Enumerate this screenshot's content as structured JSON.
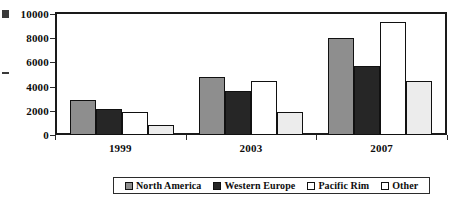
{
  "chart_data": {
    "type": "bar",
    "title": "",
    "xlabel": "",
    "ylabel": "",
    "categories": [
      "1999",
      "2003",
      "2007"
    ],
    "series": [
      {
        "name": "North America",
        "color": "#8e8e8e",
        "values": [
          2900,
          4800,
          8000
        ]
      },
      {
        "name": "Western Europe",
        "color": "#262626",
        "values": [
          2150,
          3650,
          5700
        ]
      },
      {
        "name": "Pacific Rim",
        "color": "#ffffff",
        "values": [
          1900,
          4450,
          9300
        ]
      },
      {
        "name": "Other",
        "color": "#ececec",
        "values": [
          800,
          1870,
          4450
        ]
      }
    ],
    "ylim": [
      0,
      10000
    ],
    "yticks": [
      0,
      2000,
      4000,
      6000,
      8000,
      10000
    ],
    "ytick_labels": [
      "0",
      "2000",
      "4000",
      "6000",
      "8000",
      "10000"
    ],
    "grid": false,
    "legend_position": "bottom"
  },
  "legend": {
    "items": [
      {
        "label": "North America"
      },
      {
        "label": "Western Europe"
      },
      {
        "label": "Pacific Rim"
      },
      {
        "label": "Other"
      }
    ]
  }
}
